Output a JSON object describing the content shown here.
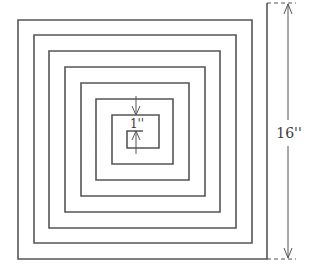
{
  "diagram": {
    "type": "square-spiral",
    "labels": {
      "inner_spacing": "1''",
      "overall_height": "16''"
    },
    "colors": {
      "line": "#555555",
      "background": "#ffffff"
    },
    "spiral_points": [
      [
        143,
        131
      ],
      [
        127,
        131
      ],
      [
        127,
        148
      ],
      [
        159,
        148
      ],
      [
        159,
        115
      ],
      [
        112,
        115
      ],
      [
        112,
        164
      ],
      [
        173,
        164
      ],
      [
        173,
        99
      ],
      [
        96,
        99
      ],
      [
        96,
        180
      ],
      [
        189,
        180
      ],
      [
        189,
        83
      ],
      [
        81,
        83
      ],
      [
        81,
        196
      ],
      [
        205,
        196
      ],
      [
        205,
        67
      ],
      [
        65,
        67
      ],
      [
        65,
        212
      ],
      [
        220,
        212
      ],
      [
        220,
        51
      ],
      [
        49,
        51
      ],
      [
        49,
        228
      ],
      [
        236,
        228
      ],
      [
        236,
        35
      ],
      [
        34,
        35
      ],
      [
        34,
        243
      ],
      [
        252,
        243
      ],
      [
        252,
        20
      ],
      [
        18,
        20
      ],
      [
        18,
        259
      ],
      [
        267,
        259
      ],
      [
        267,
        3
      ]
    ],
    "dimension_16": {
      "x": 288,
      "y_top": 3,
      "y_bottom": 259,
      "label_y": 133
    },
    "dimension_1": {
      "x": 136,
      "label_y": 127
    }
  }
}
